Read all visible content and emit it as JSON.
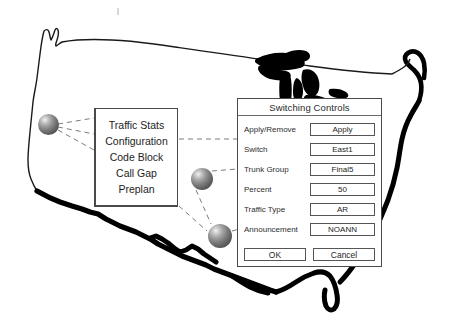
{
  "figure": {
    "background_color": "#ffffff",
    "map_outline_color": "#1a1a1a",
    "lakes_fill_color": "#000000",
    "connector_color": "#7b7b7b",
    "node_color": "#5c5c5c"
  },
  "map": {
    "name": "united-states-outline"
  },
  "nodes": [
    {
      "name": "network-node-west",
      "x": 38,
      "y": 114,
      "size": 21
    },
    {
      "name": "network-node-central",
      "x": 191,
      "y": 168,
      "size": 22
    },
    {
      "name": "network-node-south",
      "x": 208,
      "y": 225,
      "size": 24
    }
  ],
  "connectors": [
    {
      "name": "connector-west-to-menu-top",
      "x1": 58,
      "y1": 124,
      "x2": 94,
      "y2": 118
    },
    {
      "name": "connector-west-to-menu-middle",
      "x1": 58,
      "y1": 126,
      "x2": 94,
      "y2": 133
    },
    {
      "name": "connector-west-to-menu-bottom",
      "x1": 58,
      "y1": 128,
      "x2": 94,
      "y2": 148
    },
    {
      "name": "connector-menu-to-dialog",
      "x1": 178,
      "y1": 139,
      "x2": 237,
      "y2": 139
    },
    {
      "name": "connector-central-to-dialog",
      "x1": 212,
      "y1": 172,
      "x2": 237,
      "y2": 170
    },
    {
      "name": "connector-central-to-south",
      "x1": 196,
      "y1": 190,
      "x2": 212,
      "y2": 225
    },
    {
      "name": "connector-menu-to-south",
      "x1": 178,
      "y1": 207,
      "x2": 208,
      "y2": 232
    },
    {
      "name": "connector-south-to-dialog",
      "x1": 232,
      "y1": 231,
      "x2": 247,
      "y2": 228
    }
  ],
  "menu_panel": {
    "name": "traffic-management-menu",
    "items": [
      {
        "label": "Traffic Stats"
      },
      {
        "label": "Configuration"
      },
      {
        "label": "Code Block"
      },
      {
        "label": "Call Gap"
      },
      {
        "label": "Preplan"
      }
    ]
  },
  "dialog": {
    "title": "Switching Controls",
    "fields": [
      {
        "label": "Apply/Remove",
        "value": "Apply"
      },
      {
        "label": "Switch",
        "value": "East1"
      },
      {
        "label": "Trunk Group",
        "value": "Final5"
      },
      {
        "label": "Percent",
        "value": "50"
      },
      {
        "label": "Traffic Type",
        "value": "AR"
      },
      {
        "label": "Announcement",
        "value": "NOANN"
      }
    ],
    "buttons": [
      {
        "label": "OK"
      },
      {
        "label": "Cancel"
      }
    ]
  }
}
